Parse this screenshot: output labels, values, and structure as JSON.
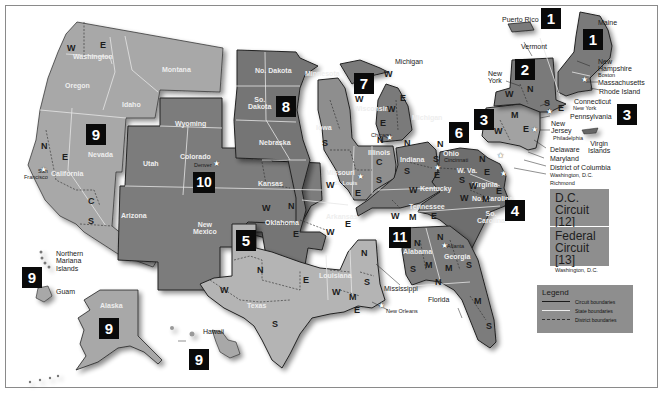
{
  "circuits": [
    {
      "number": "1",
      "states": [
        "Maine",
        "New Hampshire",
        "Massachusetts",
        "Rhode Island",
        "Puerto Rico"
      ]
    },
    {
      "number": "2",
      "states": [
        "Vermont",
        "New York",
        "Connecticut"
      ]
    },
    {
      "number": "3",
      "states": [
        "Pennsylvania",
        "New Jersey",
        "Delaware",
        "Virgin Islands"
      ]
    },
    {
      "number": "4",
      "states": [
        "Maryland",
        "W. Va.",
        "Virginia",
        "No. Carolina",
        "So. Carolina"
      ]
    },
    {
      "number": "5",
      "states": [
        "Texas",
        "Louisiana",
        "Mississippi"
      ]
    },
    {
      "number": "6",
      "states": [
        "Michigan",
        "Ohio",
        "Kentucky",
        "Tennessee"
      ]
    },
    {
      "number": "7",
      "states": [
        "Wisconsin",
        "Illinois",
        "Indiana"
      ]
    },
    {
      "number": "8",
      "states": [
        "No. Dakota",
        "So. Dakota",
        "Nebraska",
        "Minnesota",
        "Iowa",
        "Missouri",
        "Arkansas"
      ]
    },
    {
      "number": "9",
      "states": [
        "Washington",
        "Oregon",
        "Idaho",
        "Montana",
        "Nevada",
        "California",
        "Arizona",
        "Alaska",
        "Hawaii",
        "Guam",
        "Northern Mariana Islands"
      ]
    },
    {
      "number": "10",
      "states": [
        "Wyoming",
        "Utah",
        "Colorado",
        "Kansas",
        "New Mexico",
        "Oklahoma"
      ]
    },
    {
      "number": "11",
      "states": [
        "Alabama",
        "Georgia",
        "Florida"
      ]
    }
  ],
  "badges": {
    "pr": "1",
    "me": "1",
    "ny": "2",
    "pa": "3",
    "vi": "3",
    "sc": "4",
    "tx": "5",
    "oh": "6",
    "wi": "7",
    "sd": "8",
    "nv": "9",
    "mp": "9",
    "ak": "9",
    "hi": "9",
    "co": "10",
    "ga": "11"
  },
  "states": {
    "washington": "Washington",
    "oregon": "Oregon",
    "idaho": "Idaho",
    "montana": "Montana",
    "nevada": "Nevada",
    "california": "California",
    "arizona": "Arizona",
    "wyoming": "Wyoming",
    "utah": "Utah",
    "colorado": "Colorado",
    "new_mexico_1": "New",
    "new_mexico_2": "Mexico",
    "kansas": "Kansas",
    "oklahoma": "Oklahoma",
    "north_dakota": "No. Dakota",
    "south_dakota_1": "So.",
    "south_dakota_2": "Dakota",
    "nebraska": "Nebraska",
    "minnesota": "Minnesota",
    "iowa": "Iowa",
    "missouri": "Missouri",
    "arkansas": "Arkansas",
    "wisconsin": "Wisconsin",
    "illinois": "Illinois",
    "indiana": "Indiana",
    "michigan": "Michigan",
    "michigan_up": "Michigan",
    "ohio": "Ohio",
    "kentucky": "Kentucky",
    "tennessee": "Tennessee",
    "texas": "Texas",
    "louisiana": "Louisiana",
    "mississippi": "Mississippi",
    "alabama": "Alabama",
    "georgia": "Georgia",
    "florida": "Florida",
    "west_virginia": "W. Va.",
    "virginia": "Virginia",
    "north_carolina": "No. Carolina",
    "south_carolina_1": "So.",
    "south_carolina_2": "Carolina",
    "alaska": "Alaska",
    "hawaii": "Hawaii",
    "guam": "Guam",
    "n_mariana_1": "Northern",
    "n_mariana_2": "Mariana",
    "n_mariana_3": "Islands",
    "puerto_rico": "Puerto Rico",
    "virgin_islands_1": "Virgin",
    "virgin_islands_2": "Islands",
    "maine": "Maine",
    "vermont": "Vermont",
    "new_hampshire_1": "New",
    "new_hampshire_2": "Hampshire",
    "massachusetts": "Massachusetts",
    "rhode_island": "Rhode Island",
    "connecticut": "Connecticut",
    "new_york_1": "New",
    "new_york_2": "York",
    "pennsylvania": "Pennsylvania",
    "new_jersey_1": "New",
    "new_jersey_2": "Jersey",
    "delaware": "Delaware",
    "maryland": "Maryland",
    "dc": "District of Columbia"
  },
  "cities": {
    "san_francisco_1": "San",
    "san_francisco_2": "Francisco",
    "denver": "Denver",
    "st_louis": "St. Louis",
    "chicago": "Chicago",
    "cincinnati": "Cincinnati",
    "new_orleans": "New Orleans",
    "atlanta": "Atlanta",
    "richmond": "Richmond",
    "washington_dc": "Washington, D.C.",
    "philadelphia": "Philadelphia",
    "new_york": "New York",
    "boston": "Boston"
  },
  "districts": {
    "wa_w": "W",
    "wa_e": "E",
    "ca_n": "N",
    "ca_e": "E",
    "ca_c": "C",
    "ca_s": "S",
    "ok_w": "W",
    "ok_n": "N",
    "ok_e": "E",
    "tx_n": "N",
    "tx_w": "W",
    "tx_e": "E",
    "tx_s": "S",
    "la_w": "W",
    "la_m": "M",
    "la_e": "E",
    "ms_n": "N",
    "ms_s": "S",
    "ia_s": "S",
    "mo_w": "W",
    "mo_e": "E",
    "ar_w": "W",
    "ar_e": "E",
    "wi_w": "W",
    "wi_e": "E",
    "mi_w": "W",
    "mi_e": "E",
    "mi_up_w": "W",
    "il_n": "N",
    "il_c": "C",
    "il_s": "S",
    "in_n": "N",
    "in_s": "S",
    "oh_n": "N",
    "oh_s": "S",
    "ky_w": "W",
    "ky_e": "E",
    "tn_w": "W",
    "tn_m": "M",
    "tn_e": "E",
    "al_n": "N",
    "al_m": "M",
    "al_s": "S",
    "ga_n": "N",
    "ga_m": "M",
    "ga_s": "S",
    "fl_n": "N",
    "fl_m": "M",
    "fl_s": "S",
    "wv_n": "N",
    "wv_s": "S",
    "va_e": "E",
    "va_w": "W",
    "nc_w": "W",
    "nc_m": "M",
    "nc_e": "E",
    "pa_w": "W",
    "pa_m": "M",
    "pa_e": "E",
    "ny_w": "W",
    "ny_n": "N",
    "ny_s": "S",
    "ny_e": "E"
  },
  "dc_circuit": {
    "line1": "D.C.",
    "line2": "Circuit [12]",
    "location": "Washington, D.C."
  },
  "federal_circuit": {
    "line1": "Federal",
    "line2": "Circuit [13]",
    "location": "Washington, D.C."
  },
  "legend": {
    "title": "Legend",
    "items": [
      {
        "label": "Circuit boundaries",
        "style": "solid-dark"
      },
      {
        "label": "State boundaries",
        "style": "solid-white"
      },
      {
        "label": "District boundaries",
        "style": "dashed"
      }
    ]
  },
  "colors": {
    "circuit_light": "#a9a9a9",
    "circuit_medium": "#8c8c8c",
    "circuit_dark": "#6e6e6e",
    "badge": "#0a0a0a",
    "legend_bg": "#8e8e8e",
    "state_boundary": "#e8e8e8",
    "circuit_boundary": "#1a1a1a"
  }
}
